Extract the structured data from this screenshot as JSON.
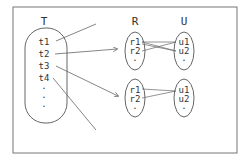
{
  "diagram": {
    "set_labels": {
      "T": "T",
      "R": "R",
      "U": "U"
    },
    "T_items": [
      "t1",
      "t2",
      "t3",
      "t4",
      ".",
      ".",
      "."
    ],
    "group1": {
      "R_items": [
        "r1",
        "r2",
        "."
      ],
      "U_items": [
        "u1",
        "u2",
        "."
      ]
    },
    "group2": {
      "R_items": [
        "r1",
        "r2",
        "."
      ],
      "U_items": [
        "u1",
        "u2",
        "."
      ]
    },
    "colors": {
      "stroke": "#555555",
      "text": "#333333",
      "background": "#ffffff"
    }
  }
}
